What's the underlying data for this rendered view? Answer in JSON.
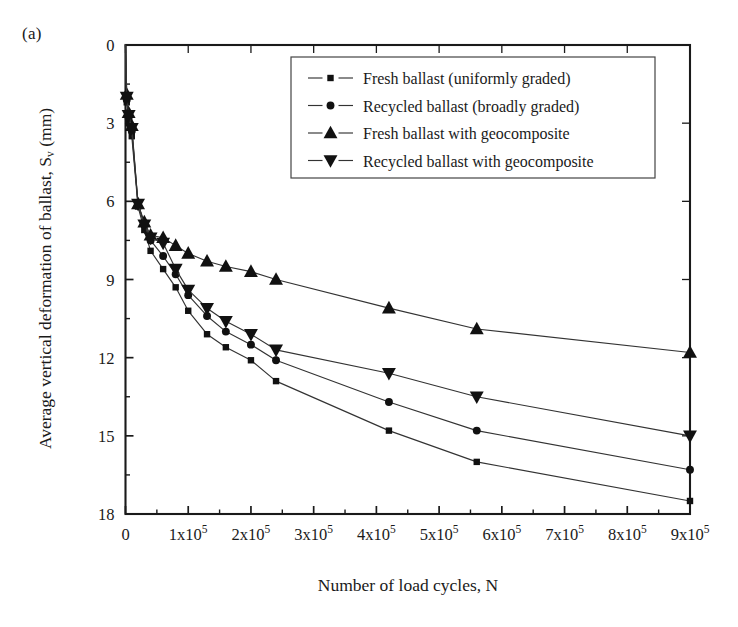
{
  "figure": {
    "panel_label": "(a)"
  },
  "axes": {
    "x_title": "Number of load cycles, N",
    "y_title_main": "Average vertical deformation of ballast, S",
    "y_title_sub": "v",
    "y_title_unit": " (mm)",
    "x_tick_labels": [
      "0",
      "1x10",
      "2x10",
      "3x10",
      "4x10",
      "5x10",
      "6x10",
      "7x10",
      "8x10",
      "9x10"
    ],
    "x_tick_exponent": "5",
    "y_tick_labels": [
      "0",
      "3",
      "6",
      "9",
      "12",
      "15",
      "18"
    ]
  },
  "legend": {
    "entries": [
      {
        "label": "Fresh ballast (uniformly graded)",
        "marker": "square"
      },
      {
        "label": "Recycled ballast (broadly graded)",
        "marker": "circle"
      },
      {
        "label": "Fresh ballast with geocomposite",
        "marker": "triangle-up"
      },
      {
        "label": "Recycled ballast with geocomposite",
        "marker": "triangle-down"
      }
    ]
  },
  "chart_data": {
    "type": "line",
    "title": "",
    "xlabel": "Number of load cycles, N",
    "ylabel": "Average vertical deformation of ballast, Sv (mm)",
    "xlim": [
      0,
      900000
    ],
    "ylim": [
      0,
      18
    ],
    "y_inverted": true,
    "grid": false,
    "legend_position": "top-center",
    "x_major_ticks": [
      0,
      100000,
      200000,
      300000,
      400000,
      500000,
      600000,
      700000,
      800000,
      900000
    ],
    "y_major_ticks": [
      0,
      3,
      6,
      9,
      12,
      15,
      18
    ],
    "y_minor_step": 1.5,
    "x_minor_step": 50000,
    "series": [
      {
        "name": "Fresh ballast (uniformly graded)",
        "marker": "square",
        "points": [
          [
            0,
            0
          ],
          [
            2000,
            2.2
          ],
          [
            5000,
            3.0
          ],
          [
            10000,
            3.5
          ],
          [
            20000,
            6.2
          ],
          [
            30000,
            7.1
          ],
          [
            40000,
            7.9
          ],
          [
            60000,
            8.6
          ],
          [
            80000,
            9.3
          ],
          [
            100000,
            10.2
          ],
          [
            130000,
            11.1
          ],
          [
            160000,
            11.6
          ],
          [
            200000,
            12.1
          ],
          [
            240000,
            12.9
          ],
          [
            420000,
            14.8
          ],
          [
            560000,
            16.0
          ],
          [
            900000,
            17.5
          ]
        ]
      },
      {
        "name": "Recycled ballast (broadly graded)",
        "marker": "circle",
        "points": [
          [
            0,
            0
          ],
          [
            2000,
            2.1
          ],
          [
            5000,
            2.8
          ],
          [
            10000,
            3.3
          ],
          [
            20000,
            6.1
          ],
          [
            30000,
            6.9
          ],
          [
            40000,
            7.5
          ],
          [
            60000,
            8.1
          ],
          [
            80000,
            8.8
          ],
          [
            100000,
            9.6
          ],
          [
            130000,
            10.4
          ],
          [
            160000,
            11.0
          ],
          [
            200000,
            11.5
          ],
          [
            240000,
            12.1
          ],
          [
            420000,
            13.7
          ],
          [
            560000,
            14.8
          ],
          [
            900000,
            16.3
          ]
        ]
      },
      {
        "name": "Fresh ballast with geocomposite",
        "marker": "triangle-up",
        "points": [
          [
            0,
            0
          ],
          [
            2000,
            1.9
          ],
          [
            5000,
            2.6
          ],
          [
            10000,
            3.1
          ],
          [
            20000,
            6.1
          ],
          [
            30000,
            6.8
          ],
          [
            40000,
            7.3
          ],
          [
            60000,
            7.4
          ],
          [
            80000,
            7.7
          ],
          [
            100000,
            8.0
          ],
          [
            130000,
            8.3
          ],
          [
            160000,
            8.5
          ],
          [
            200000,
            8.7
          ],
          [
            240000,
            9.0
          ],
          [
            420000,
            10.1
          ],
          [
            560000,
            10.9
          ],
          [
            900000,
            11.8
          ]
        ]
      },
      {
        "name": "Recycled ballast with geocomposite",
        "marker": "triangle-down",
        "points": [
          [
            0,
            0
          ],
          [
            2000,
            2.0
          ],
          [
            5000,
            2.7
          ],
          [
            10000,
            3.2
          ],
          [
            20000,
            6.1
          ],
          [
            30000,
            6.9
          ],
          [
            40000,
            7.4
          ],
          [
            60000,
            7.6
          ],
          [
            80000,
            8.6
          ],
          [
            100000,
            9.4
          ],
          [
            130000,
            10.1
          ],
          [
            160000,
            10.6
          ],
          [
            200000,
            11.1
          ],
          [
            240000,
            11.7
          ],
          [
            420000,
            12.6
          ],
          [
            560000,
            13.5
          ],
          [
            900000,
            15.0
          ]
        ]
      }
    ]
  }
}
